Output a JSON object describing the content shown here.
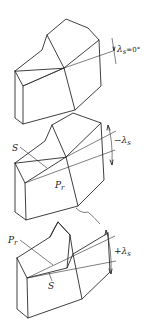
{
  "diagram": {
    "panels": [
      {
        "id": "zero",
        "angle_label": "λs=0°",
        "labels": []
      },
      {
        "id": "negative",
        "angle_label": "−λs",
        "labels": [
          "S",
          "Pr"
        ]
      },
      {
        "id": "positive",
        "angle_label": "+λs",
        "labels": [
          "Pr",
          "S"
        ]
      }
    ]
  },
  "labels": {
    "p1_angle": "λ",
    "p1_angle_sub": "s",
    "p1_angle_val": "=0°",
    "p2_angle": "−λ",
    "p2_angle_sub": "s",
    "p2_S": "S",
    "p2_Pr": "P",
    "p2_Pr_sub": "r",
    "p3_angle": "+λ",
    "p3_angle_sub": "s",
    "p3_S": "S",
    "p3_Pr": "P",
    "p3_Pr_sub": "r"
  },
  "colors": {
    "line": "#2a2a2a",
    "background": "#ffffff"
  }
}
